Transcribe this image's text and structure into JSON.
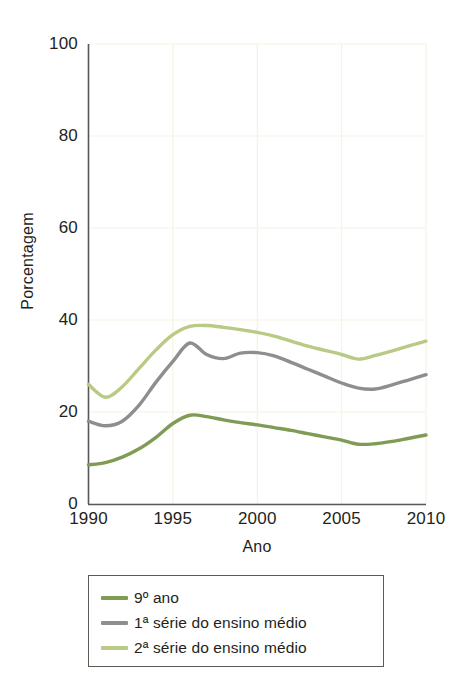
{
  "chart_data": {
    "type": "line",
    "title": "",
    "xlabel": "Ano",
    "ylabel": "Porcentagem",
    "xlim": [
      1990,
      2010
    ],
    "ylim": [
      0,
      100
    ],
    "xticks": [
      "1990",
      "1995",
      "2000",
      "2005",
      "2010"
    ],
    "yticks": [
      "0",
      "20",
      "40",
      "60",
      "80",
      "100"
    ],
    "grid": true,
    "legend_position": "below-plot",
    "x": [
      1990,
      1991,
      1992,
      1993,
      1994,
      1995,
      1996,
      1997,
      1998,
      1999,
      2000,
      2001,
      2002,
      2003,
      2004,
      2005,
      2006,
      2007,
      2008,
      2009,
      2010
    ],
    "series": [
      {
        "name": "9º ano",
        "color": "#7f9b54",
        "values": [
          8.5,
          9.0,
          10.2,
          12.0,
          14.5,
          17.5,
          19.3,
          19.0,
          18.3,
          17.7,
          17.2,
          16.6,
          16.0,
          15.3,
          14.6,
          13.9,
          13.0,
          13.1,
          13.6,
          14.3,
          15.0
        ]
      },
      {
        "name": "1ª série do ensino médio",
        "color": "#8e8e8e",
        "values": [
          18.0,
          17.0,
          18.0,
          21.5,
          26.5,
          31.0,
          35.0,
          32.5,
          31.6,
          32.8,
          32.9,
          32.2,
          30.8,
          29.3,
          27.8,
          26.3,
          25.2,
          25.0,
          25.9,
          27.0,
          28.1
        ]
      },
      {
        "name": "2ª série do ensino médio",
        "color": "#b9ca84",
        "values": [
          26.0,
          23.2,
          25.5,
          29.5,
          33.5,
          36.8,
          38.6,
          38.8,
          38.4,
          37.9,
          37.3,
          36.5,
          35.4,
          34.3,
          33.4,
          32.5,
          31.5,
          32.3,
          33.3,
          34.4,
          35.4
        ]
      }
    ]
  },
  "axes": {
    "ylabel": "Porcentagem",
    "xlabel": "Ano",
    "yticks": [
      "100",
      "80",
      "60",
      "40",
      "20",
      "0"
    ],
    "xticks": [
      "1990",
      "1995",
      "2000",
      "2005",
      "2010"
    ]
  },
  "legend": {
    "items": [
      {
        "label": "9º ano",
        "color": "#7f9b54"
      },
      {
        "label": "1ª série do ensino médio",
        "color": "#8e8e8e"
      },
      {
        "label": "2ª série do ensino médio",
        "color": "#b9ca84"
      }
    ]
  },
  "colors": {
    "axis": "#58585a",
    "grid": "#f4f3e4",
    "text": "#231f20",
    "legend_border": "#5a5a52"
  }
}
